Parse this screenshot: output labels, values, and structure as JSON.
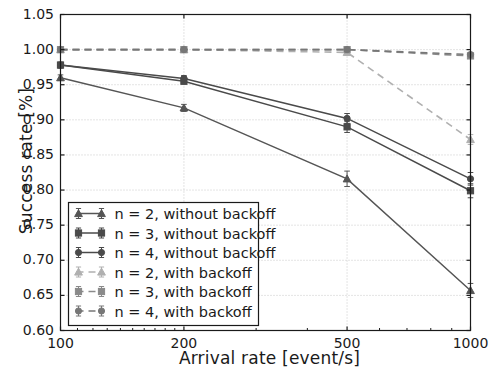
{
  "chart_data": {
    "type": "line",
    "title": "",
    "xlabel": "Arrival rate [event/s]",
    "ylabel": "Success rate [%]",
    "xscale": "log",
    "x": [
      100,
      200,
      500,
      1000
    ],
    "xticklabels": [
      "100",
      "200",
      "500",
      "1000"
    ],
    "xlim": [
      100,
      1000
    ],
    "ylim": [
      0.6,
      1.05
    ],
    "yticklabels": [
      "0.60",
      "0.65",
      "0.70",
      "0.75",
      "0.80",
      "0.85",
      "0.90",
      "0.95",
      "1.00",
      "1.05"
    ],
    "yticks": [
      0.6,
      0.65,
      0.7,
      0.75,
      0.8,
      0.85,
      0.9,
      0.95,
      1.0,
      1.05
    ],
    "grid": true,
    "legend_position": "lower left",
    "series": [
      {
        "name": "n = 2, without backoff",
        "marker": "triangle",
        "linestyle": "solid",
        "color": "#555555",
        "values": [
          0.96,
          0.917,
          0.816,
          0.657
        ],
        "errors": [
          0.004,
          0.005,
          0.011,
          0.01
        ]
      },
      {
        "name": "n = 3, without backoff",
        "marker": "square",
        "linestyle": "solid",
        "color": "#4a4a4a",
        "values": [
          0.978,
          0.955,
          0.89,
          0.799
        ],
        "errors": [
          0.004,
          0.004,
          0.008,
          0.01
        ]
      },
      {
        "name": "n = 4, without backoff",
        "marker": "circle",
        "linestyle": "solid",
        "color": "#4a4a4a",
        "values": [
          0.978,
          0.959,
          0.902,
          0.816
        ],
        "errors": [
          0.004,
          0.004,
          0.007,
          0.009
        ]
      },
      {
        "name": "n = 2, with backoff",
        "marker": "triangle",
        "linestyle": "dashed",
        "color": "#b0b0b0",
        "values": [
          1.0,
          1.0,
          0.996,
          0.872
        ],
        "errors": [
          0.0,
          0.0,
          0.002,
          0.007
        ]
      },
      {
        "name": "n = 3, with backoff",
        "marker": "square",
        "linestyle": "dashed",
        "color": "#8a8a8a",
        "values": [
          1.0,
          1.0,
          1.0,
          0.991
        ],
        "errors": [
          0.0,
          0.0,
          0.0,
          0.002
        ]
      },
      {
        "name": "n = 4, with backoff",
        "marker": "circle",
        "linestyle": "dashed",
        "color": "#777777",
        "values": [
          1.0,
          1.0,
          1.0,
          0.993
        ],
        "errors": [
          0.0,
          0.0,
          0.0,
          0.002
        ]
      }
    ]
  },
  "legend": {
    "items": [
      "n = 2, without backoff",
      "n = 3, without backoff",
      "n = 4, without backoff",
      "n = 2, with backoff",
      "n = 3, with backoff",
      "n = 4, with backoff"
    ]
  },
  "colors": {
    "axis": "#1a1a1a",
    "grid": "#c8c8c8",
    "background": "#ffffff",
    "dark_line": "#4a4a4a",
    "light_line": "#b0b0b0"
  }
}
